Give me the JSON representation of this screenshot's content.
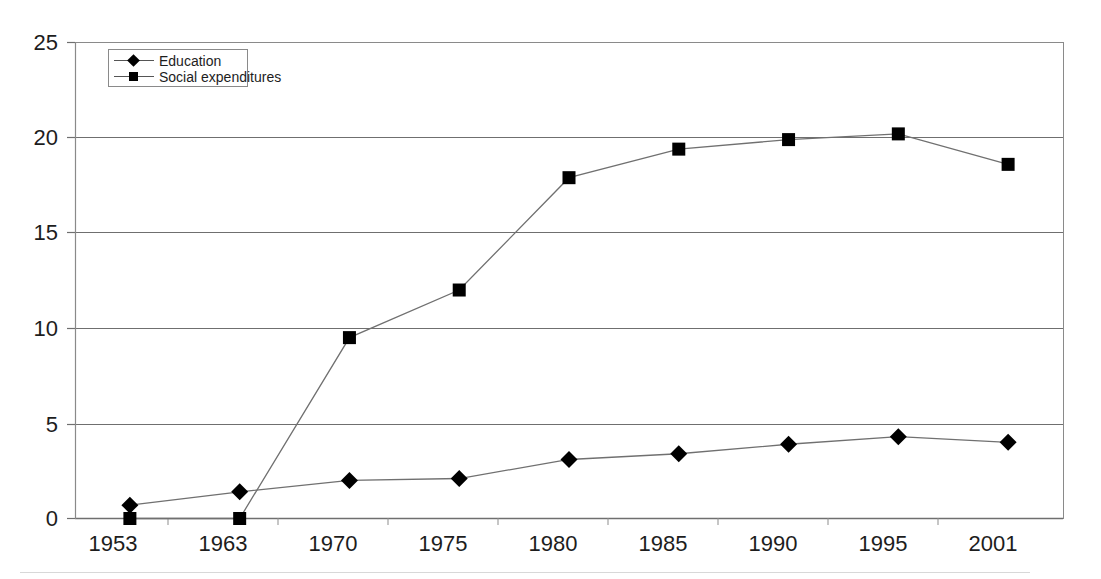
{
  "chart_data": {
    "type": "line",
    "title": "",
    "subtitle": "",
    "xlabel": "",
    "ylabel": "",
    "categories": [
      "1953",
      "1963",
      "1970",
      "1975",
      "1980",
      "1985",
      "1990",
      "1995",
      "2001"
    ],
    "ylim": [
      0,
      25
    ],
    "yticks": [
      0,
      5,
      10,
      15,
      20,
      25
    ],
    "ytick_labels": [
      "0",
      "5",
      "10",
      "15",
      "20",
      "25"
    ],
    "grid": "horizontal",
    "legend_position": "top-left inside plot area",
    "series": [
      {
        "name": "Education",
        "marker": "diamond",
        "color": "#000000",
        "values": [
          0.7,
          1.4,
          2.0,
          2.1,
          3.1,
          3.4,
          3.9,
          4.3,
          4.0
        ]
      },
      {
        "name": "Social expenditures",
        "marker": "square",
        "color": "#000000",
        "values": [
          0.0,
          0.0,
          9.5,
          12.0,
          17.9,
          19.4,
          19.9,
          20.2,
          18.6
        ]
      }
    ]
  },
  "legend": {
    "items": [
      {
        "label": "Education",
        "marker": "diamond"
      },
      {
        "label": "Social expenditures",
        "marker": "square"
      }
    ]
  },
  "axes": {
    "y": {
      "labels": [
        "25",
        "20",
        "15",
        "10",
        "5",
        "0"
      ]
    },
    "x": {
      "labels": [
        "1953",
        "1963",
        "1970",
        "1975",
        "1980",
        "1985",
        "1990",
        "1995",
        "2001"
      ]
    }
  },
  "style": {
    "background": "#ffffff",
    "axis_color": "#6e6e6e",
    "grid_color": "#777777",
    "series_line_color": "#707070",
    "marker_color": "#000000"
  }
}
